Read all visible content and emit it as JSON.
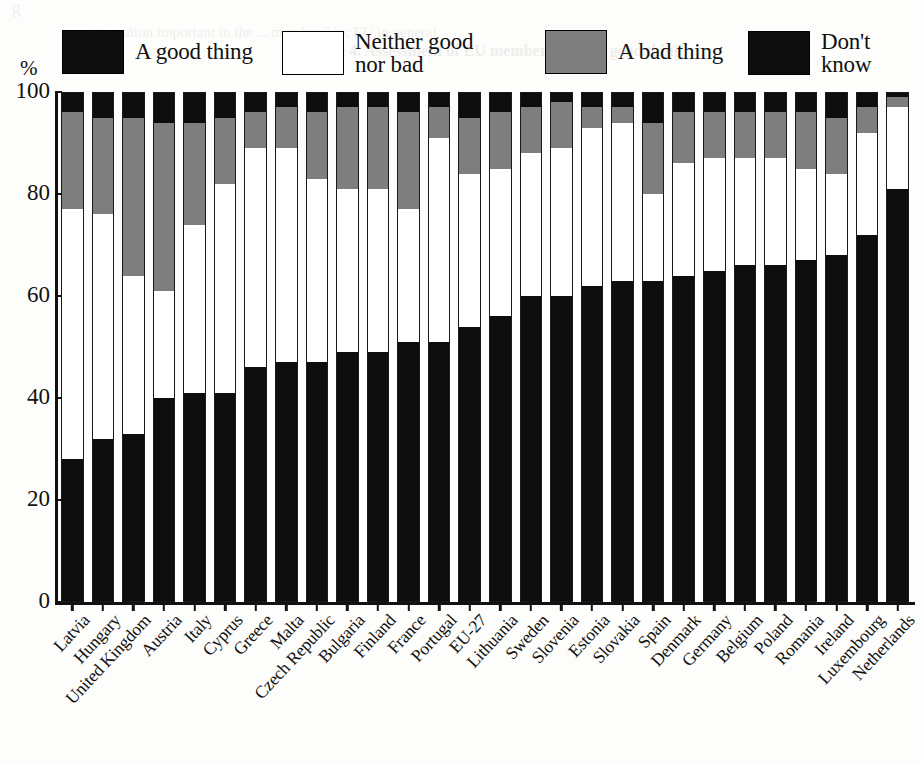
{
  "units_label": "%",
  "legend": {
    "items": [
      {
        "label": "A good thing",
        "swatch": "black",
        "key": "good"
      },
      {
        "label": "Neither good\nnor bad",
        "swatch": "white",
        "key": "neither"
      },
      {
        "label": "A bad thing",
        "swatch": "gray",
        "key": "bad"
      },
      {
        "label": "Don't know",
        "swatch": "black",
        "key": "dk"
      }
    ]
  },
  "colors": {
    "good": "#0d0d0d",
    "neither": "#ffffff",
    "bad": "#7e7e7e",
    "dk": "#0d0d0d",
    "axis": "#111111",
    "outline": "#1a1a1a"
  },
  "ghost_text": {
    "line_a": "g",
    "line_b": "integration important in the ... membership; EU in general",
    "line_c": "Figure 4. Assessment of EU membership as a good thing"
  },
  "chart_data": {
    "type": "bar",
    "subtype": "stacked-bar-100-percent",
    "title": "",
    "xlabel": "",
    "ylabel": "%",
    "ylim": [
      0,
      100
    ],
    "yticks": [
      0,
      20,
      40,
      60,
      80,
      100
    ],
    "ytick_labels": [
      "0",
      "20",
      "40",
      "60",
      "80",
      "100"
    ],
    "grid": false,
    "legend_position": "top",
    "stack_order": [
      "good",
      "neither",
      "bad",
      "dk"
    ],
    "categories": [
      "Latvia",
      "Hungary",
      "United Kingdom",
      "Austria",
      "Italy",
      "Cyprus",
      "Greece",
      "Malta",
      "Czech Republic",
      "Bulgaria",
      "Finland",
      "France",
      "Portugal",
      "EU-27",
      "Lithuania",
      "Sweden",
      "Slovenia",
      "Estonia",
      "Slovakia",
      "Spain",
      "Denmark",
      "Germany",
      "Belgium",
      "Poland",
      "Romania",
      "Ireland",
      "Luxembourg",
      "Netherlands"
    ],
    "series": [
      {
        "name": "A good thing",
        "key": "good",
        "color": "#0d0d0d",
        "values": [
          28,
          32,
          33,
          40,
          41,
          41,
          46,
          47,
          47,
          49,
          49,
          51,
          51,
          54,
          56,
          60,
          60,
          62,
          63,
          63,
          64,
          65,
          66,
          66,
          67,
          68,
          72,
          81
        ]
      },
      {
        "name": "Neither good nor bad",
        "key": "neither",
        "color": "#ffffff",
        "values": [
          49,
          44,
          31,
          21,
          33,
          41,
          43,
          42,
          36,
          32,
          32,
          26,
          40,
          30,
          29,
          28,
          29,
          31,
          31,
          17,
          22,
          22,
          21,
          21,
          18,
          16,
          20,
          16
        ]
      },
      {
        "name": "A bad thing",
        "key": "bad",
        "color": "#7e7e7e",
        "values": [
          19,
          19,
          31,
          33,
          20,
          13,
          7,
          8,
          13,
          16,
          16,
          19,
          6,
          11,
          11,
          9,
          9,
          4,
          3,
          14,
          10,
          9,
          9,
          9,
          11,
          11,
          5,
          2
        ]
      },
      {
        "name": "Don't know",
        "key": "dk",
        "color": "#0d0d0d",
        "values": [
          4,
          5,
          5,
          6,
          6,
          5,
          4,
          3,
          4,
          3,
          3,
          4,
          3,
          5,
          4,
          3,
          2,
          3,
          3,
          6,
          4,
          4,
          4,
          4,
          4,
          5,
          3,
          1
        ]
      }
    ]
  }
}
